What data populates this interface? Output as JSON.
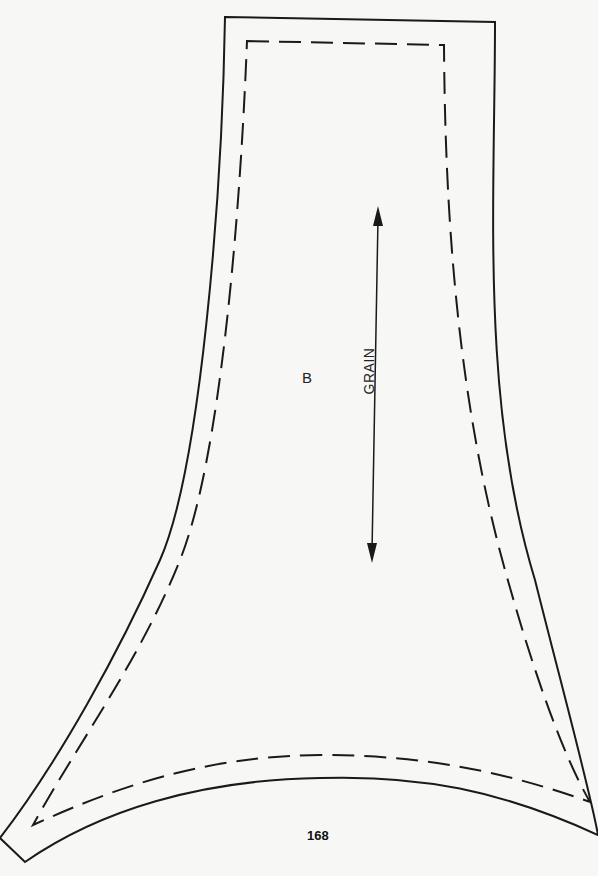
{
  "diagram": {
    "type": "sewing-pattern-piece",
    "piece_label": "B",
    "grain_label": "GRAIN",
    "page_number": "168",
    "line_color": "#1a1a1a",
    "background_color": "#f7f7f5",
    "lines": {
      "cutting_line": "solid",
      "seam_line": "dashed",
      "grainline": "double-headed arrow"
    }
  }
}
